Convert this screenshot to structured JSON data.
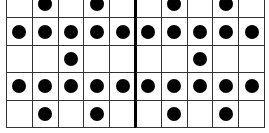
{
  "figure": {
    "left_grid": {
      "rows": 5,
      "cols": 5,
      "cells": [
        [
          0,
          1,
          0,
          1,
          0
        ],
        [
          1,
          1,
          1,
          1,
          1
        ],
        [
          0,
          0,
          1,
          0,
          0
        ],
        [
          1,
          1,
          1,
          1,
          1
        ],
        [
          0,
          1,
          0,
          1,
          0
        ]
      ]
    },
    "right_grid": {
      "rows": 5,
      "cols": 5,
      "cells": [
        [
          0,
          1,
          0,
          1,
          0
        ],
        [
          1,
          1,
          1,
          1,
          1
        ],
        [
          0,
          0,
          1,
          0,
          0
        ],
        [
          1,
          1,
          1,
          1,
          1
        ],
        [
          0,
          1,
          0,
          1,
          0
        ]
      ]
    },
    "colors": {
      "dot": "#000000",
      "line": "#333333",
      "background": "#ffffff"
    }
  }
}
